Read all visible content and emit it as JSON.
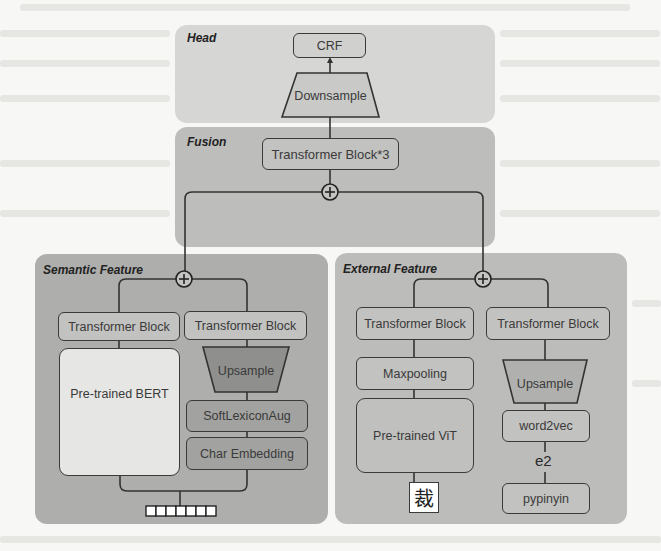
{
  "diagram": {
    "type": "model-architecture",
    "panels": {
      "head": {
        "title": "Head",
        "nodes": {
          "crf": "CRF",
          "downsample": "Downsample"
        }
      },
      "fusion": {
        "title": "Fusion",
        "nodes": {
          "transformer": "Transformer Block*3",
          "add": "+"
        }
      },
      "semantic": {
        "title": "Semantic Feature",
        "nodes": {
          "transformer_left": "Transformer Block",
          "transformer_right": "Transformer Block",
          "bert": "Pre-trained BERT",
          "upsample": "Upsample",
          "softlexicon": "SoftLexiconAug",
          "char_embedding": "Char Embedding",
          "add": "+",
          "token_count": 7
        }
      },
      "external": {
        "title": "External Feature",
        "nodes": {
          "transformer_left": "Transformer Block",
          "transformer_right": "Transformer Block",
          "maxpooling": "Maxpooling",
          "vit": "Pre-trained ViT",
          "glyph_char": "裁",
          "upsample": "Upsample",
          "word2vec": "word2vec",
          "edge_label": "e2",
          "pypinyin": "pypinyin",
          "add": "+"
        }
      }
    },
    "edges": [
      [
        "Downsample",
        "CRF"
      ],
      [
        "Transformer Block*3",
        "Downsample"
      ],
      [
        "fusion.add",
        "Transformer Block*3"
      ],
      [
        "semantic.add",
        "fusion.add"
      ],
      [
        "external.add",
        "fusion.add"
      ],
      [
        "semantic.transformer_left",
        "semantic.add"
      ],
      [
        "semantic.transformer_right",
        "semantic.add"
      ],
      [
        "Pre-trained BERT",
        "semantic.transformer_left"
      ],
      [
        "Upsample",
        "semantic.transformer_right"
      ],
      [
        "SoftLexiconAug",
        "Upsample"
      ],
      [
        "Char Embedding",
        "SoftLexiconAug"
      ],
      [
        "tokens",
        "Pre-trained BERT"
      ],
      [
        "tokens",
        "Char Embedding"
      ],
      [
        "external.transformer_left",
        "external.add"
      ],
      [
        "external.transformer_right",
        "external.add"
      ],
      [
        "Maxpooling",
        "external.transformer_left"
      ],
      [
        "Pre-trained ViT",
        "Maxpooling"
      ],
      [
        "裁",
        "Pre-trained ViT"
      ],
      [
        "Upsample",
        "external.transformer_right"
      ],
      [
        "word2vec",
        "Upsample"
      ],
      [
        "pypinyin",
        "word2vec"
      ]
    ]
  },
  "colors": {
    "background": "#f7f7f5",
    "head_panel": "#d6d6d4",
    "fusion_panel": "#bdbdbb",
    "semantic_panel": "#aeaeac",
    "external_panel": "#bcbcba",
    "stroke": "#3a3a3a"
  }
}
